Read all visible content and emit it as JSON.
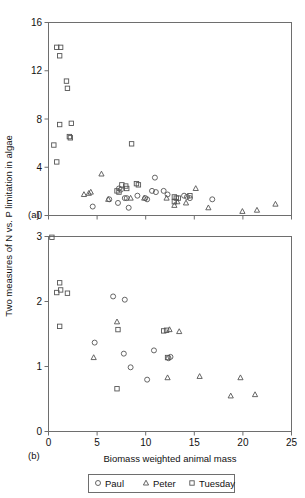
{
  "figure": {
    "ylabel": "Two measures of N vs. P limitation in algae",
    "xlabel": "Biomass weighted animal mass",
    "panel_a_label": "(a)",
    "panel_b_label": "(b)",
    "legend": [
      {
        "name": "Paul",
        "marker": "circle"
      },
      {
        "name": "Peter",
        "marker": "triangle"
      },
      {
        "name": "Tuesday",
        "marker": "square"
      }
    ],
    "colors": {
      "axis": "#6e6e6e",
      "marker": "#555555",
      "text": "#111111",
      "background": "#ffffff"
    }
  },
  "chart_data": [
    {
      "type": "scatter",
      "panel": "(a)",
      "title": "",
      "xlabel": "",
      "ylabel": "Two measures of N vs. P limitation in algae",
      "xlim": [
        0,
        25
      ],
      "ylim": [
        0,
        16
      ],
      "xticks": [
        0,
        5,
        10,
        15,
        20,
        25
      ],
      "yticks": [
        0,
        4,
        8,
        12,
        16
      ],
      "xticklabels": [
        "",
        "",
        "",
        "",
        "",
        ""
      ],
      "yticklabels": [
        "0",
        "4",
        "8",
        "12",
        "16"
      ],
      "grid": false,
      "legend_position": "below-figure",
      "series": [
        {
          "name": "Tuesday",
          "marker": "square",
          "points": [
            [
              0.9,
              13.9
            ],
            [
              1.3,
              13.9
            ],
            [
              1.2,
              13.2
            ],
            [
              1.9,
              11.1
            ],
            [
              2.0,
              10.5
            ],
            [
              1.2,
              7.5
            ],
            [
              2.4,
              7.6
            ],
            [
              2.2,
              6.5
            ],
            [
              2.3,
              6.4
            ],
            [
              0.6,
              5.8
            ],
            [
              0.9,
              4.4
            ],
            [
              8.6,
              5.9
            ],
            [
              7.6,
              2.5
            ],
            [
              8.0,
              2.4
            ],
            [
              8.1,
              2.2
            ],
            [
              7.1,
              2.0
            ],
            [
              7.3,
              1.9
            ],
            [
              9.1,
              2.6
            ],
            [
              9.3,
              2.5
            ],
            [
              13.0,
              1.5
            ],
            [
              13.2,
              1.4
            ],
            [
              13.4,
              1.4
            ],
            [
              13.0,
              1.1
            ],
            [
              14.6,
              1.6
            ]
          ]
        },
        {
          "name": "Paul",
          "marker": "circle",
          "points": [
            [
              4.6,
              0.7
            ],
            [
              6.3,
              1.3
            ],
            [
              7.2,
              1.0
            ],
            [
              7.3,
              2.2
            ],
            [
              7.5,
              2.1
            ],
            [
              7.9,
              1.4
            ],
            [
              8.1,
              1.4
            ],
            [
              8.3,
              0.6
            ],
            [
              9.2,
              1.6
            ],
            [
              10.0,
              1.4
            ],
            [
              10.2,
              1.3
            ],
            [
              11.0,
              3.1
            ],
            [
              10.7,
              2.0
            ],
            [
              11.1,
              1.9
            ],
            [
              11.9,
              2.0
            ],
            [
              12.3,
              1.7
            ],
            [
              14.0,
              1.6
            ],
            [
              14.3,
              1.5
            ],
            [
              14.6,
              1.4
            ],
            [
              16.9,
              1.3
            ]
          ]
        },
        {
          "name": "Peter",
          "marker": "triangle",
          "points": [
            [
              3.7,
              1.7
            ],
            [
              4.2,
              1.8
            ],
            [
              4.4,
              1.9
            ],
            [
              5.5,
              3.4
            ],
            [
              6.2,
              1.3
            ],
            [
              8.5,
              1.4
            ],
            [
              9.9,
              1.4
            ],
            [
              12.2,
              1.4
            ],
            [
              13.0,
              0.8
            ],
            [
              13.3,
              1.1
            ],
            [
              14.2,
              1.0
            ],
            [
              15.2,
              2.2
            ],
            [
              16.5,
              0.6
            ],
            [
              20.0,
              0.3
            ],
            [
              21.5,
              0.4
            ],
            [
              23.4,
              0.9
            ]
          ]
        }
      ]
    },
    {
      "type": "scatter",
      "panel": "(b)",
      "title": "",
      "xlabel": "Biomass weighted animal mass",
      "ylabel": "Two measures of N vs. P limitation in algae",
      "xlim": [
        0,
        25
      ],
      "ylim": [
        0,
        3
      ],
      "xticks": [
        0,
        5,
        10,
        15,
        20,
        25
      ],
      "yticks": [
        0,
        1,
        2,
        3
      ],
      "xticklabels": [
        "0",
        "5",
        "10",
        "15",
        "20",
        "25"
      ],
      "yticklabels": [
        "0",
        "1",
        "2",
        "3"
      ],
      "grid": false,
      "legend_position": "below-figure",
      "series": [
        {
          "name": "Tuesday",
          "marker": "square",
          "points": [
            [
              0.4,
              2.98
            ],
            [
              0.9,
              2.13
            ],
            [
              1.2,
              2.28
            ],
            [
              1.3,
              2.17
            ],
            [
              2.0,
              2.12
            ],
            [
              1.2,
              1.61
            ],
            [
              7.2,
              1.56
            ],
            [
              7.1,
              0.65
            ],
            [
              11.9,
              1.54
            ],
            [
              12.2,
              1.55
            ],
            [
              12.3,
              1.13
            ]
          ]
        },
        {
          "name": "Paul",
          "marker": "circle",
          "points": [
            [
              6.7,
              2.07
            ],
            [
              7.9,
              2.02
            ],
            [
              4.8,
              1.36
            ],
            [
              7.8,
              1.19
            ],
            [
              8.5,
              0.98
            ],
            [
              10.9,
              1.24
            ],
            [
              10.2,
              0.79
            ],
            [
              12.4,
              1.12
            ],
            [
              12.6,
              1.14
            ]
          ]
        },
        {
          "name": "Peter",
          "marker": "triangle",
          "points": [
            [
              4.7,
              1.13
            ],
            [
              7.1,
              1.68
            ],
            [
              12.5,
              1.56
            ],
            [
              13.5,
              1.53
            ],
            [
              12.3,
              0.82
            ],
            [
              15.6,
              0.84
            ],
            [
              19.8,
              0.82
            ],
            [
              18.8,
              0.54
            ],
            [
              21.3,
              0.56
            ]
          ]
        }
      ]
    }
  ]
}
